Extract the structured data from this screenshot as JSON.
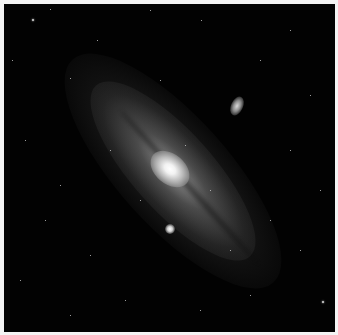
{
  "image": {
    "subject": "Andromeda galaxy",
    "description": "Spiral galaxy seen at a steep angle with bright core, dust lanes, two satellite galaxies, and a dark star field",
    "colors": {
      "background": "#020202",
      "border": "#f4f4f4",
      "core": "#ffffff"
    }
  },
  "stars": [
    {
      "x": 32,
      "y": 19,
      "s": 2
    },
    {
      "x": 50,
      "y": 9,
      "s": 1
    },
    {
      "x": 97,
      "y": 40,
      "s": 1
    },
    {
      "x": 150,
      "y": 10,
      "s": 1
    },
    {
      "x": 201,
      "y": 20,
      "s": 1
    },
    {
      "x": 290,
      "y": 30,
      "s": 1
    },
    {
      "x": 12,
      "y": 60,
      "s": 1
    },
    {
      "x": 70,
      "y": 78,
      "s": 1
    },
    {
      "x": 260,
      "y": 60,
      "s": 1
    },
    {
      "x": 310,
      "y": 95,
      "s": 1
    },
    {
      "x": 25,
      "y": 140,
      "s": 1
    },
    {
      "x": 290,
      "y": 150,
      "s": 1
    },
    {
      "x": 320,
      "y": 190,
      "s": 1
    },
    {
      "x": 45,
      "y": 220,
      "s": 1
    },
    {
      "x": 90,
      "y": 255,
      "s": 1
    },
    {
      "x": 20,
      "y": 280,
      "s": 1
    },
    {
      "x": 125,
      "y": 300,
      "s": 1
    },
    {
      "x": 70,
      "y": 315,
      "s": 1
    },
    {
      "x": 200,
      "y": 310,
      "s": 1
    },
    {
      "x": 250,
      "y": 295,
      "s": 1
    },
    {
      "x": 322,
      "y": 301,
      "s": 2
    },
    {
      "x": 300,
      "y": 250,
      "s": 1
    },
    {
      "x": 270,
      "y": 220,
      "s": 1
    },
    {
      "x": 140,
      "y": 200,
      "s": 1
    },
    {
      "x": 110,
      "y": 150,
      "s": 1
    },
    {
      "x": 185,
      "y": 145,
      "s": 1
    },
    {
      "x": 210,
      "y": 190,
      "s": 1
    },
    {
      "x": 160,
      "y": 80,
      "s": 1
    },
    {
      "x": 230,
      "y": 250,
      "s": 1
    },
    {
      "x": 60,
      "y": 185,
      "s": 1
    }
  ]
}
